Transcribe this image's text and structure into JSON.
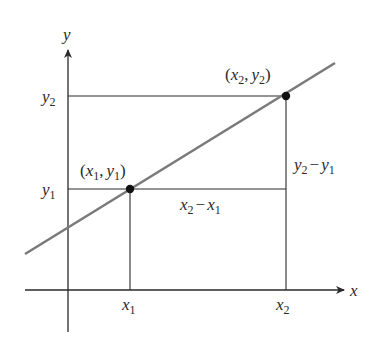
{
  "diagram": {
    "axes": {
      "x_label": "x",
      "y_label": "y"
    },
    "points": [
      {
        "name": "P1",
        "label_open": "(",
        "x_sym": "x",
        "x_sub": "1",
        "comma": ",",
        "y_sym": "y",
        "y_sub": "1",
        "label_close": ")"
      },
      {
        "name": "P2",
        "label_open": "(",
        "x_sym": "x",
        "x_sub": "2",
        "comma": ",",
        "y_sym": "y",
        "y_sub": "2",
        "label_close": ")"
      }
    ],
    "ticks": {
      "x1": {
        "sym": "x",
        "sub": "1"
      },
      "x2": {
        "sym": "x",
        "sub": "2"
      },
      "y1": {
        "sym": "y",
        "sub": "1"
      },
      "y2": {
        "sym": "y",
        "sub": "2"
      }
    },
    "run_label": {
      "a_sym": "x",
      "a_sub": "2",
      "minus": "−",
      "b_sym": "x",
      "b_sub": "1"
    },
    "rise_label": {
      "a_sym": "y",
      "a_sub": "2",
      "minus": "−",
      "b_sym": "y",
      "b_sub": "1"
    },
    "colors": {
      "axis": "#2a2a2a",
      "line": "#7a7a7a",
      "point": "#111111"
    }
  }
}
